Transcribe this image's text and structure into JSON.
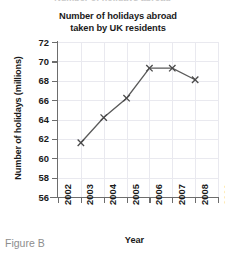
{
  "clipped_heading": "Number of holidays abroad",
  "figure_caption": "Figure B",
  "chart_data": {
    "type": "line",
    "title": "Number of holidays abroad\ntaken by UK residents",
    "title_line1": "Number of holidays abroad",
    "title_line2": "taken by UK residents",
    "xlabel": "Year",
    "ylabel": "Number of holidays (millions)",
    "x": [
      2003,
      2004,
      2005,
      2006,
      2007,
      2008
    ],
    "values": [
      61.6,
      64.2,
      66.2,
      69.3,
      69.3,
      68.1
    ],
    "xlim": [
      2002,
      2009
    ],
    "ylim": [
      56,
      72
    ],
    "xticks": [
      2002,
      2003,
      2004,
      2005,
      2006,
      2007,
      2008,
      2009
    ],
    "yticks": [
      56,
      58,
      60,
      62,
      64,
      66,
      68,
      70,
      72
    ],
    "xtick_labels": [
      "2002",
      "2003",
      "2004",
      "2005",
      "2006",
      "2007",
      "2008",
      "2009"
    ],
    "ytick_labels": [
      "56",
      "58",
      "60",
      "62",
      "64",
      "66",
      "68",
      "70",
      "72"
    ],
    "grid": true,
    "legend": null,
    "marker": "x",
    "line_color": "#5a5a5a",
    "marker_color": "#4a4a4a",
    "grid_color": "#e9e9ef",
    "axis_color": "#6d6d6d"
  }
}
